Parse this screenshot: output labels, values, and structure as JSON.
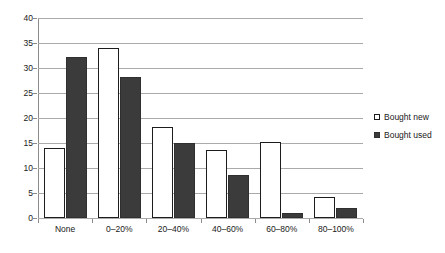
{
  "chart_data": {
    "type": "bar",
    "title": "",
    "subtitle": "",
    "xlabel": "",
    "ylabel": "",
    "ylim": [
      0,
      40
    ],
    "ytick_step": 5,
    "yticks": [
      0,
      5,
      10,
      15,
      20,
      25,
      30,
      35,
      40
    ],
    "grid": true,
    "legend_position": "right",
    "categories": [
      "None",
      "0–20%",
      "20–40%",
      "40–60%",
      "60–80%",
      "80–100%"
    ],
    "series": [
      {
        "name": "Bought new",
        "color": "#ffffff",
        "values": [
          14.1,
          34.1,
          18.3,
          13.7,
          15.2,
          4.2
        ]
      },
      {
        "name": "Bought used",
        "color": "#3b3b3b",
        "values": [
          32.2,
          28.2,
          15.0,
          8.7,
          1.0,
          2.0
        ]
      }
    ]
  },
  "legend": {
    "items": [
      {
        "label": "Bought new",
        "swatch": "hollow-square-icon"
      },
      {
        "label": "Bought used",
        "swatch": "filled-square-icon"
      }
    ]
  },
  "axis": {
    "y_tick_labels": [
      "40",
      "35",
      "30",
      "25",
      "20",
      "15",
      "10",
      "5",
      "0"
    ],
    "x_tick_labels": [
      "None",
      "0–20%",
      "20–40%",
      "40–60%",
      "60–80%",
      "80–100%"
    ]
  },
  "colors": {
    "series_new": "#ffffff",
    "series_used": "#3b3b3b",
    "gridline": "#aaaaaa",
    "axis": "#8c8c8c",
    "text": "#1a1a1a",
    "background": "#ffffff"
  }
}
